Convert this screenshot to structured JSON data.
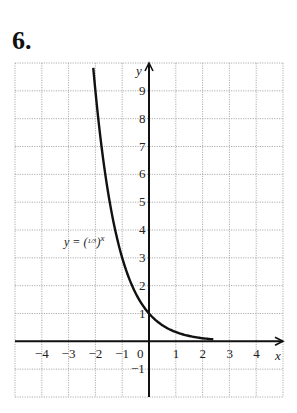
{
  "problem": {
    "number": "6."
  },
  "chart_data": {
    "type": "line",
    "title": "",
    "xlabel": "x",
    "ylabel": "y",
    "xlim": [
      -5,
      5
    ],
    "ylim": [
      -2,
      10
    ],
    "grid": true,
    "x_ticks": [
      "-4",
      "-3",
      "-2",
      "-1",
      "0",
      "1",
      "2",
      "3",
      "4"
    ],
    "y_ticks": [
      "9",
      "8",
      "7",
      "6",
      "5",
      "4",
      "3",
      "2",
      "1",
      "-1"
    ],
    "series": [
      {
        "name": "y = (1/3)^x",
        "function": "(1/3)^x",
        "x": [
          -2.1,
          -2,
          -1.5,
          -1,
          -0.5,
          0,
          0.5,
          1,
          1.5,
          2,
          2.4
        ],
        "y": [
          10.05,
          9,
          5.2,
          3,
          1.73,
          1,
          0.58,
          0.33,
          0.19,
          0.11,
          0.07
        ]
      }
    ],
    "annotations": [
      {
        "text": "y = (1/3)^x",
        "x": -3.2,
        "y": 3.9
      }
    ]
  },
  "labels": {
    "curve_label_prefix": "y = (",
    "curve_label_frac": "1/3",
    "curve_label_suffix": ")",
    "curve_label_exp": "x",
    "x_axis": "x",
    "y_axis": "y",
    "x_ticks": [
      "−4",
      "−3",
      "−2",
      "−1",
      "0",
      "1",
      "2",
      "3",
      "4"
    ],
    "y_ticks": [
      "9",
      "8",
      "7",
      "6",
      "5",
      "4",
      "3",
      "2",
      "1",
      "−1"
    ]
  }
}
